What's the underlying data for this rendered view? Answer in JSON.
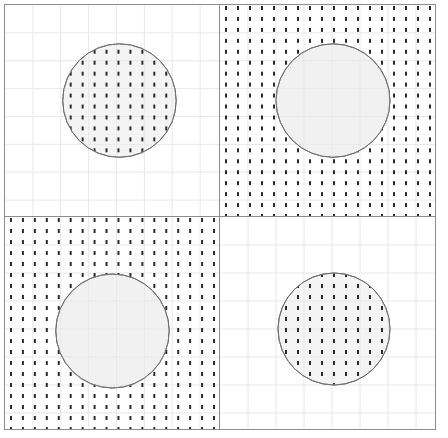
{
  "figure": {
    "title": "",
    "width": 448,
    "height": 438,
    "background_color": "#ffffff",
    "border_color": "#8d8d8d",
    "grid_color": "#e8e8ec",
    "grid_spacing": 28,
    "outline_color": "#6f6f6f",
    "fill_color": "#f4f4f4",
    "hatch_color": "#2a2a2a",
    "hatch_pattern": "vertical-dashes",
    "hatch_dash_width": 2,
    "hatch_dash_height": 4,
    "hatch_dash_gap": 7,
    "hatch_column_spacing": 12
  },
  "chart_data": {
    "type": "scatter",
    "title": "",
    "subtitle": "",
    "xlabel": "",
    "ylabel": "",
    "grid": true,
    "legend_position": "none",
    "layout": {
      "rows": 2,
      "cols": 2
    },
    "panels": [
      {
        "id": "panel-top-left",
        "row": 0,
        "col": 0,
        "label": "",
        "hatch_mode": "inside",
        "shape": "circle",
        "cx": 115,
        "cy": 96,
        "r": 57,
        "fill": "#f4f4f4",
        "stroke": "#6f6f6f"
      },
      {
        "id": "panel-top-right",
        "row": 0,
        "col": 1,
        "label": "",
        "hatch_mode": "outside",
        "shape": "circle",
        "cx": 113,
        "cy": 96,
        "r": 57,
        "fill": "#f1f1f1",
        "stroke": "#6f6f6f"
      },
      {
        "id": "panel-bottom-left",
        "row": 1,
        "col": 0,
        "label": "",
        "hatch_mode": "outside",
        "shape": "circle",
        "cx": 108,
        "cy": 114,
        "r": 57,
        "fill": "#f1f1f1",
        "stroke": "#6f6f6f"
      },
      {
        "id": "panel-bottom-right",
        "row": 1,
        "col": 1,
        "label": "",
        "hatch_mode": "inside",
        "shape": "circle",
        "cx": 114,
        "cy": 112,
        "r": 56,
        "fill": "#f4f4f4",
        "stroke": "#6f6f6f"
      }
    ]
  }
}
